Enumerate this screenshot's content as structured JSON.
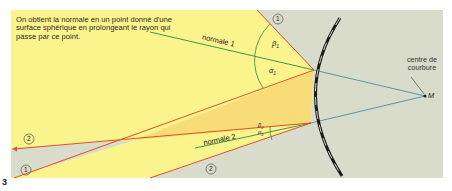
{
  "caption": "On obtient la normale en un point donné d'une surface sphérique en prolongeant le rayon qui passe par ce point.",
  "figure_number": "3",
  "labels": {
    "normale1": "normale 1",
    "normale2": "normale 2",
    "centre": "centre de courbure",
    "point_m": "M",
    "beta1": "β",
    "beta1_sub": "1",
    "alpha1": "α",
    "alpha1_sub": "1",
    "beta2": "β",
    "beta2_sub": "2",
    "alpha2": "α",
    "alpha2_sub": "2",
    "ray1": "1",
    "ray2": "2"
  },
  "colors": {
    "background_gray": "#d9dccb",
    "light_yellow": "#fbf38c",
    "beam_yellow": "#f7dc78",
    "ray_red": "#e0502a",
    "normal_green": "#3d9a4a",
    "radius_blue": "#4d8fa8",
    "mirror_black": "#1a1a1a"
  }
}
